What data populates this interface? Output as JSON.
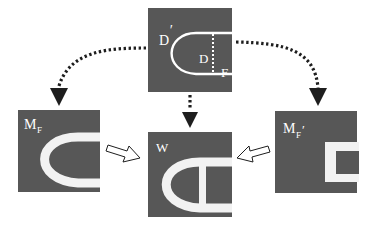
{
  "diagram": {
    "colors": {
      "panel": "#575757",
      "shape": "#ffffff",
      "arrow": "#1e1e1e",
      "background": "#ffffff"
    },
    "panels": {
      "top": {
        "label": "D",
        "label_prime": "′",
        "inner_label_d": "D",
        "inner_label_f": "F"
      },
      "left": {
        "label": "M",
        "subscript": "F"
      },
      "center": {
        "label": "W"
      },
      "right": {
        "label": "M",
        "subscript": "F",
        "prime": "′"
      }
    },
    "arrows": {
      "dotted": [
        "top-to-left",
        "top-to-center",
        "top-to-right"
      ],
      "hollow": [
        "left-to-center",
        "right-to-center"
      ]
    }
  }
}
